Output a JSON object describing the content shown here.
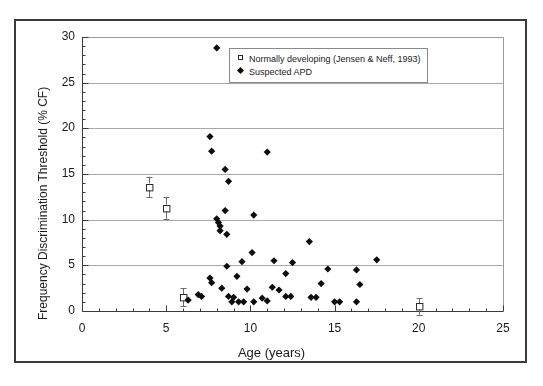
{
  "chart_data": {
    "type": "scatter",
    "title": "",
    "xlabel": "Age (years)",
    "ylabel": "Frequency Discrimination Threshold (% CF)",
    "xlim": [
      0,
      25
    ],
    "ylim": [
      0,
      30
    ],
    "xticks": [
      "0",
      "5",
      "10",
      "15",
      "20",
      "25"
    ],
    "xtick_values": [
      0,
      5,
      10,
      15,
      20,
      25
    ],
    "yticks": [
      "0",
      "5",
      "10",
      "15",
      "20",
      "25",
      "30"
    ],
    "ytick_values": [
      0,
      5,
      10,
      15,
      20,
      25,
      30
    ],
    "x_minor_tick_interval": 1,
    "y_minor_tick_interval": 1,
    "grid": "horizontal-major-only",
    "grid_color": "#a8a8a8",
    "legend_position": "top-right-inside",
    "series": [
      {
        "name": "Normally developing (Jensen & Neff, 1993)",
        "marker": "open-square",
        "marker_color": "#ffffff",
        "marker_edge_color": "#2b2b2b",
        "has_error_bars": true,
        "points": [
          {
            "x": 4.0,
            "y": 13.6,
            "yerr": 1.1
          },
          {
            "x": 5.0,
            "y": 11.3,
            "yerr": 1.2
          },
          {
            "x": 6.0,
            "y": 1.5,
            "yerr": 1.0
          },
          {
            "x": 20.0,
            "y": 0.5,
            "yerr": 0.9
          }
        ]
      },
      {
        "name": "Suspected APD",
        "marker": "filled-diamond",
        "marker_color": "#0d0d0d",
        "has_error_bars": false,
        "points": [
          {
            "x": 8.0,
            "y": 28.8
          },
          {
            "x": 7.6,
            "y": 19.1
          },
          {
            "x": 7.7,
            "y": 17.5
          },
          {
            "x": 11.0,
            "y": 17.4
          },
          {
            "x": 8.5,
            "y": 15.5
          },
          {
            "x": 8.7,
            "y": 14.2
          },
          {
            "x": 8.5,
            "y": 11.0
          },
          {
            "x": 10.2,
            "y": 10.5
          },
          {
            "x": 8.0,
            "y": 10.1
          },
          {
            "x": 8.1,
            "y": 9.7
          },
          {
            "x": 8.2,
            "y": 9.3
          },
          {
            "x": 8.2,
            "y": 8.8
          },
          {
            "x": 8.6,
            "y": 8.4
          },
          {
            "x": 13.5,
            "y": 7.6
          },
          {
            "x": 10.1,
            "y": 6.4
          },
          {
            "x": 17.5,
            "y": 5.6
          },
          {
            "x": 11.4,
            "y": 5.5
          },
          {
            "x": 12.5,
            "y": 5.3
          },
          {
            "x": 9.5,
            "y": 5.4
          },
          {
            "x": 8.6,
            "y": 4.9
          },
          {
            "x": 14.6,
            "y": 4.6
          },
          {
            "x": 16.3,
            "y": 4.5
          },
          {
            "x": 12.1,
            "y": 4.1
          },
          {
            "x": 9.2,
            "y": 3.8
          },
          {
            "x": 7.6,
            "y": 3.6
          },
          {
            "x": 7.7,
            "y": 3.1
          },
          {
            "x": 14.2,
            "y": 3.0
          },
          {
            "x": 16.5,
            "y": 2.9
          },
          {
            "x": 11.3,
            "y": 2.6
          },
          {
            "x": 8.3,
            "y": 2.5
          },
          {
            "x": 9.8,
            "y": 2.4
          },
          {
            "x": 11.7,
            "y": 2.3
          },
          {
            "x": 6.9,
            "y": 1.8
          },
          {
            "x": 7.1,
            "y": 1.6
          },
          {
            "x": 8.7,
            "y": 1.6
          },
          {
            "x": 9.0,
            "y": 1.5
          },
          {
            "x": 12.1,
            "y": 1.6
          },
          {
            "x": 12.4,
            "y": 1.6
          },
          {
            "x": 10.7,
            "y": 1.4
          },
          {
            "x": 13.6,
            "y": 1.5
          },
          {
            "x": 13.9,
            "y": 1.5
          },
          {
            "x": 16.3,
            "y": 1.0
          },
          {
            "x": 6.3,
            "y": 1.2
          },
          {
            "x": 8.9,
            "y": 1.0
          },
          {
            "x": 9.3,
            "y": 1.0
          },
          {
            "x": 9.6,
            "y": 1.0
          },
          {
            "x": 10.2,
            "y": 1.0
          },
          {
            "x": 11.0,
            "y": 1.1
          },
          {
            "x": 15.0,
            "y": 1.0
          },
          {
            "x": 15.3,
            "y": 1.0
          }
        ]
      }
    ]
  },
  "legend": {
    "entries": [
      {
        "label": "Normally developing (Jensen & Neff, 1993)",
        "marker": "open-square"
      },
      {
        "label": "Suspected APD",
        "marker": "filled-diamond"
      }
    ]
  }
}
